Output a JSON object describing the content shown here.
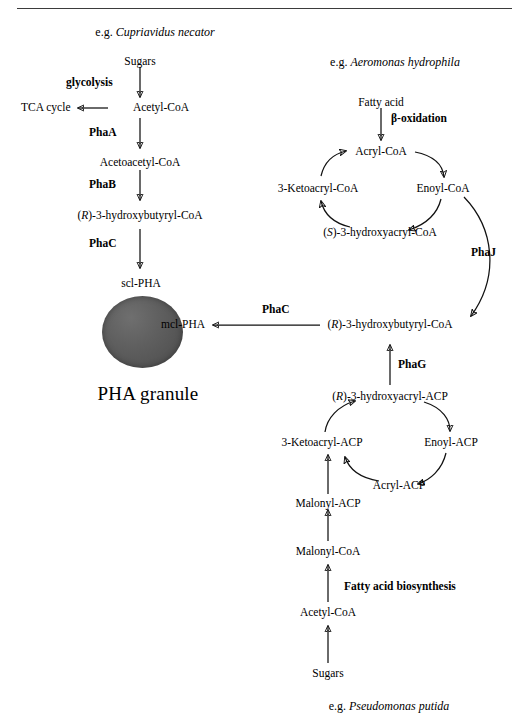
{
  "figure": {
    "top_rule": true,
    "granule_color": "#5a5a5a",
    "stroke_color": "#111111"
  },
  "species_captions": {
    "left": {
      "prefix": "e.g. ",
      "name": "Cupriavidus necator"
    },
    "right_top": {
      "prefix": "e.g. ",
      "name": "Aeromonas hydrophila"
    },
    "right_bottom": {
      "prefix": "e.g. ",
      "name": "Pseudomonas putida"
    }
  },
  "granule": {
    "product_label": "scl-PHA",
    "caption": "PHA granule",
    "mcl_label": "mcl-PHA"
  },
  "pathways": {
    "glycolysis_scl": {
      "title": "Cupriavidus necator",
      "metabolites": [
        {
          "id": "sugars",
          "text": "Sugars"
        },
        {
          "id": "acetyl-coa",
          "text": "Acetyl-CoA"
        },
        {
          "id": "tca-cycle",
          "text": "TCA cycle"
        },
        {
          "id": "acetoacetyl-coa",
          "text": "Acetoacetyl-CoA"
        },
        {
          "id": "r-3-hydroxybutyryl-coa",
          "text": "(R)-3-hydroxybutyryl-CoA",
          "italic_prefix": "R"
        },
        {
          "id": "scl-pha",
          "text": "scl-PHA"
        }
      ],
      "enzymes": [
        {
          "id": "glycolysis",
          "text": "glycolysis"
        },
        {
          "id": "phaa",
          "text": "PhaA"
        },
        {
          "id": "phab",
          "text": "PhaB"
        },
        {
          "id": "phac-scl",
          "text": "PhaC"
        }
      ]
    },
    "beta_oxidation": {
      "title": "Aeromonas hydrophila",
      "metabolites": [
        {
          "id": "fatty-acid",
          "text": "Fatty acid"
        },
        {
          "id": "acryl-coa",
          "text": "Acryl-CoA"
        },
        {
          "id": "enoyl-coa",
          "text": "Enoyl-CoA"
        },
        {
          "id": "s-3-hydroxyacryl-coa",
          "text": "(S)-3-hydroxyacryl-CoA",
          "italic_prefix": "S"
        },
        {
          "id": "3-ketoacryl-coa",
          "text": "3-Ketoacryl-CoA"
        }
      ],
      "enzymes": [
        {
          "id": "beta-oxidation",
          "text": "β-oxidation"
        },
        {
          "id": "phaj",
          "text": "PhaJ"
        }
      ]
    },
    "fatty_acid_biosynthesis": {
      "title": "Pseudomonas putida",
      "metabolites": [
        {
          "id": "r-3-hydroxybutyryl-coa-mcl",
          "text": "(R)-3-hydroxybutyryl-CoA",
          "italic_prefix": "R"
        },
        {
          "id": "r-3-hydroxyacryl-acp",
          "text": "(R)-3-hydroxyacryl-ACP",
          "italic_prefix": "R"
        },
        {
          "id": "enoyl-acp",
          "text": "Enoyl-ACP"
        },
        {
          "id": "acryl-acp",
          "text": "Acryl-ACP"
        },
        {
          "id": "3-ketoacryl-acp",
          "text": "3-Ketoacryl-ACP"
        },
        {
          "id": "malonyl-acp",
          "text": "Malonyl-ACP"
        },
        {
          "id": "malonyl-coa",
          "text": "Malonyl-CoA"
        },
        {
          "id": "acetyl-coa-fab",
          "text": "Acetyl-CoA"
        },
        {
          "id": "sugars-fab",
          "text": "Sugars"
        }
      ],
      "enzymes": [
        {
          "id": "phag",
          "text": "PhaG"
        },
        {
          "id": "fatty-acid-biosynthesis",
          "text": "Fatty acid biosynthesis"
        },
        {
          "id": "phac-mcl",
          "text": "PhaC"
        }
      ]
    }
  },
  "text": {
    "sugars": "Sugars",
    "glycolysis": "glycolysis",
    "tca_cycle": "TCA cycle",
    "acetyl_coa": "Acetyl-CoA",
    "phaa": "PhaA",
    "acetoacetyl_coa": "Acetoacetyl-CoA",
    "phab": "PhaB",
    "r_prefix_open": "(",
    "r_letter": "R",
    "r_suffix_hb_coa": ")-3-hydroxybutyryl-CoA",
    "phac": "PhaC",
    "scl_pha": "scl-PHA",
    "pha_granule": "PHA granule",
    "mcl_pha": "mcl-PHA",
    "fatty_acid": "Fatty acid",
    "beta_oxidation": "β-oxidation",
    "acryl_coa": "Acryl-CoA",
    "enoyl_coa": "Enoyl-CoA",
    "three_ketoacryl_coa": "3-Ketoacryl-CoA",
    "s_letter": "S",
    "s_suffix_ha_coa": ")-3-hydroxyacryl-CoA",
    "phaj": "PhaJ",
    "phag": "PhaG",
    "r_suffix_ha_acp": ")-3-hydroxyacryl-ACP",
    "three_ketoacryl_acp": "3-Ketoacryl-ACP",
    "enoyl_acp": "Enoyl-ACP",
    "acryl_acp": "Acryl-ACP",
    "malonyl_acp": "Malonyl-ACP",
    "malonyl_coa": "Malonyl-CoA",
    "fatty_acid_biosynthesis": "Fatty acid biosynthesis",
    "eg": "e.g. ",
    "cupriavidus_necator": "Cupriavidus necator",
    "aeromonas_hydrophila": "Aeromonas hydrophila",
    "pseudomonas_putida": "Pseudomonas putida"
  }
}
